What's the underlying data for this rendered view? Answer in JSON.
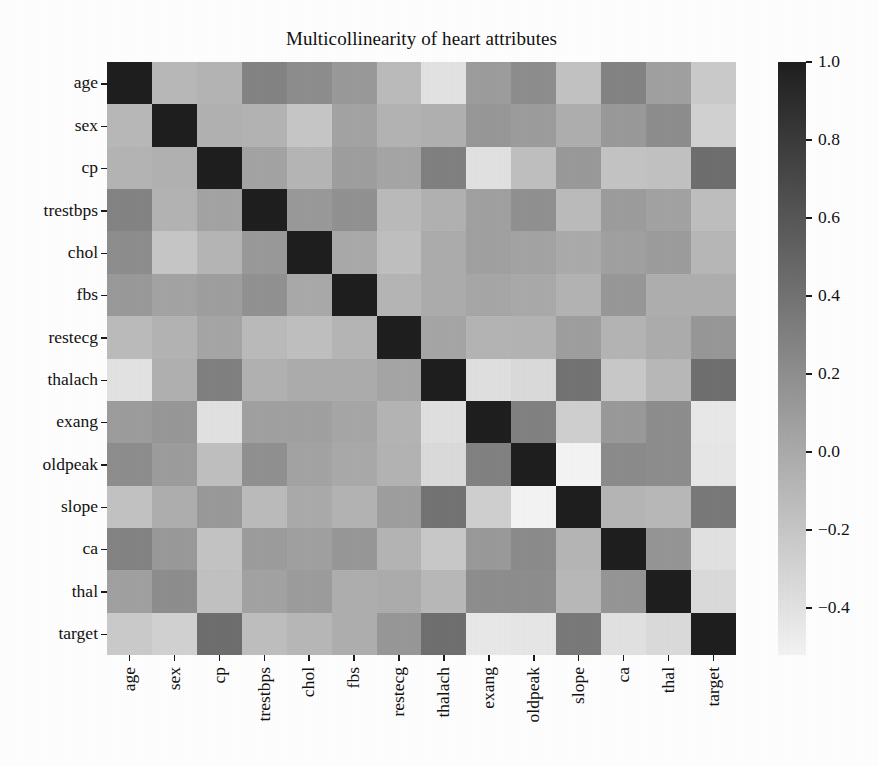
{
  "chart_data": {
    "type": "heatmap",
    "title": "Multicollinearity of heart attributes",
    "xlabel": "",
    "ylabel": "",
    "colormap": "gray_r",
    "grid": false,
    "legend_position": "right-colorbar",
    "colorbar": {
      "ticks": [
        "1.0",
        "0.8",
        "0.6",
        "0.4",
        "0.2",
        "0.0",
        "−0.2",
        "−0.4"
      ],
      "tick_values": [
        1.0,
        0.8,
        0.6,
        0.4,
        0.2,
        0.0,
        -0.2,
        -0.4
      ],
      "vmin": -0.52,
      "vmax": 1.0,
      "dark_color": "#1f1f1f",
      "light_color": "#f4f4f4"
    },
    "x_categories": [
      "age",
      "sex",
      "cp",
      "trestbps",
      "chol",
      "fbs",
      "restecg",
      "thalach",
      "exang",
      "oldpeak",
      "slope",
      "ca",
      "thal",
      "target"
    ],
    "y_categories": [
      "age",
      "sex",
      "cp",
      "trestbps",
      "chol",
      "fbs",
      "restecg",
      "thalach",
      "exang",
      "oldpeak",
      "slope",
      "ca",
      "thal",
      "target"
    ],
    "matrix": [
      [
        1.0,
        -0.1,
        -0.07,
        0.28,
        0.21,
        0.12,
        -0.12,
        -0.4,
        0.1,
        0.21,
        -0.17,
        0.28,
        0.07,
        -0.23
      ],
      [
        -0.1,
        1.0,
        -0.05,
        -0.06,
        -0.2,
        0.05,
        -0.06,
        -0.04,
        0.14,
        0.1,
        -0.03,
        0.12,
        0.21,
        -0.28
      ],
      [
        -0.07,
        -0.05,
        1.0,
        0.05,
        -0.08,
        0.09,
        0.04,
        0.3,
        -0.39,
        -0.15,
        0.12,
        -0.18,
        -0.16,
        0.43
      ],
      [
        0.28,
        -0.06,
        0.05,
        1.0,
        0.12,
        0.18,
        -0.11,
        -0.05,
        0.07,
        0.19,
        -0.12,
        0.1,
        0.06,
        -0.14
      ],
      [
        0.21,
        -0.2,
        -0.08,
        0.12,
        1.0,
        0.01,
        -0.15,
        -0.01,
        0.07,
        0.05,
        -0.0,
        0.07,
        0.1,
        -0.09
      ],
      [
        0.12,
        0.05,
        0.09,
        0.18,
        0.01,
        1.0,
        -0.08,
        -0.01,
        0.03,
        0.01,
        -0.06,
        0.14,
        -0.03,
        -0.03
      ],
      [
        -0.12,
        -0.06,
        0.04,
        -0.11,
        -0.15,
        -0.08,
        1.0,
        0.04,
        -0.07,
        -0.06,
        0.09,
        -0.07,
        -0.01,
        0.14
      ],
      [
        -0.4,
        -0.04,
        0.3,
        -0.05,
        -0.01,
        -0.01,
        0.04,
        1.0,
        -0.38,
        -0.34,
        0.39,
        -0.21,
        -0.1,
        0.42
      ],
      [
        0.1,
        0.14,
        -0.39,
        0.07,
        0.07,
        0.03,
        -0.07,
        -0.38,
        1.0,
        0.29,
        -0.26,
        0.12,
        0.21,
        -0.44
      ],
      [
        0.21,
        0.1,
        -0.15,
        0.19,
        0.05,
        0.01,
        -0.06,
        -0.34,
        0.29,
        1.0,
        -0.58,
        0.22,
        0.21,
        -0.43
      ],
      [
        -0.17,
        -0.03,
        0.12,
        -0.12,
        -0.0,
        -0.06,
        0.09,
        0.39,
        -0.26,
        -0.58,
        1.0,
        -0.08,
        -0.1,
        0.35
      ],
      [
        0.28,
        0.12,
        -0.18,
        0.1,
        0.07,
        0.14,
        -0.07,
        -0.21,
        0.12,
        0.22,
        -0.08,
        1.0,
        0.15,
        -0.39
      ],
      [
        0.07,
        0.21,
        -0.16,
        0.06,
        0.1,
        -0.03,
        -0.01,
        -0.1,
        0.21,
        0.21,
        -0.1,
        0.15,
        1.0,
        -0.34
      ],
      [
        -0.23,
        -0.28,
        0.43,
        -0.14,
        -0.09,
        -0.03,
        0.14,
        0.42,
        -0.44,
        -0.43,
        0.35,
        -0.39,
        -0.34,
        1.0
      ]
    ]
  }
}
